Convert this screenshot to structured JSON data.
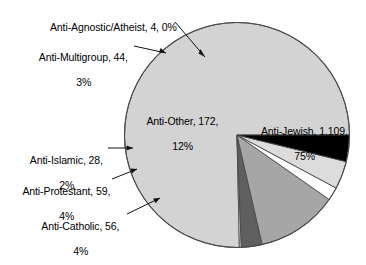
{
  "chart_data": {
    "type": "pie",
    "title": "",
    "subtitle": "",
    "xlabel": "",
    "ylabel": "",
    "legend_position": "none",
    "grid": false,
    "total": 1472,
    "categories": [
      "Anti-Jewish",
      "Anti-Agnostic/Atheist",
      "Anti-Multigroup",
      "Anti-Other",
      "Anti-Islamic",
      "Anti-Protestant",
      "Anti-Catholic"
    ],
    "values": [
      1109,
      4,
      44,
      172,
      28,
      59,
      56
    ],
    "percents": [
      75,
      0,
      3,
      12,
      2,
      4,
      4
    ],
    "slices": [
      {
        "name": "Anti-Jewish",
        "value": 1109,
        "value_text": "1,109",
        "percent": 75,
        "percent_text": "75%",
        "color": "#d3d3d3",
        "label_text": "Anti-Jewish, 1,109,\n75%",
        "label_placement": "inside-right"
      },
      {
        "name": "Anti-Agnostic/Atheist",
        "value": 4,
        "value_text": "4",
        "percent": 0,
        "percent_text": "0%",
        "color": "#ececec",
        "label_text": "Anti-Agnostic/Atheist, 4, 0%",
        "label_placement": "outside-top-left"
      },
      {
        "name": "Anti-Multigroup",
        "value": 44,
        "value_text": "44",
        "percent": 3,
        "percent_text": "3%",
        "color": "#5f5f5f",
        "label_text": "Anti-Multigroup, 44,\n3%",
        "label_placement": "outside-top-left"
      },
      {
        "name": "Anti-Other",
        "value": 172,
        "value_text": "172",
        "percent": 12,
        "percent_text": "12%",
        "color": "#a6a6a6",
        "label_text": "Anti-Other, 172,\n12%",
        "label_placement": "inside-left"
      },
      {
        "name": "Anti-Islamic",
        "value": 28,
        "value_text": "28",
        "percent": 2,
        "percent_text": "2%",
        "color": "#ffffff",
        "label_text": "Anti-Islamic, 28,\n2%",
        "label_placement": "outside-left"
      },
      {
        "name": "Anti-Protestant",
        "value": 59,
        "value_text": "59",
        "percent": 4,
        "percent_text": "4%",
        "color": "#dcdcdc",
        "label_text": "Anti-Protestant, 59,\n4%",
        "label_placement": "outside-left"
      },
      {
        "name": "Anti-Catholic",
        "value": 56,
        "value_text": "56",
        "percent": 4,
        "percent_text": "4%",
        "color": "#000000",
        "label_text": "Anti-Catholic, 56,\n4%",
        "label_placement": "outside-lower-left"
      }
    ]
  },
  "labels": {
    "anti_agnostic": "Anti-Agnostic/Atheist, 4, 0%",
    "anti_multigroup_l1": "Anti-Multigroup, 44,",
    "anti_multigroup_l2": "3%",
    "anti_other_l1": "Anti-Other, 172,",
    "anti_other_l2": "12%",
    "anti_jewish_l1": "Anti-Jewish, 1,109,",
    "anti_jewish_l2": "75%",
    "anti_islamic_l1": "Anti-Islamic, 28,",
    "anti_islamic_l2": "2%",
    "anti_protestant_l1": "Anti-Protestant, 59,",
    "anti_protestant_l2": "4%",
    "anti_catholic_l1": "Anti-Catholic, 56,",
    "anti_catholic_l2": "4%"
  },
  "colors": {
    "anti_jewish": "#d3d3d3",
    "anti_agnostic": "#ececec",
    "anti_multigroup": "#5f5f5f",
    "anti_other": "#a6a6a6",
    "anti_islamic": "#ffffff",
    "anti_protestant": "#dcdcdc",
    "anti_catholic": "#000000",
    "outline": "#4a4a4a",
    "text": "#000000",
    "background": "#ffffff"
  }
}
